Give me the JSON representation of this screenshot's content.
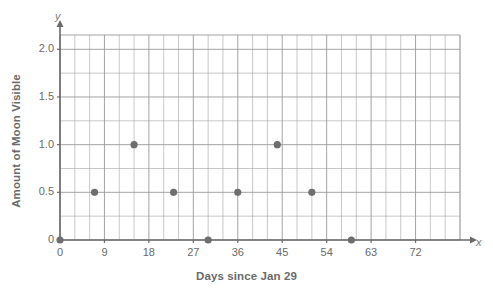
{
  "chart_data": {
    "type": "scatter",
    "title": "",
    "xlabel": "Days since Jan 29",
    "ylabel": "Amount of Moon Visible",
    "x_axis_letter": "x",
    "y_axis_letter": "y",
    "xlim": [
      0,
      81
    ],
    "ylim": [
      0,
      2.15
    ],
    "xticks": [
      0,
      9,
      18,
      27,
      36,
      45,
      54,
      63,
      72
    ],
    "xtick_labels": [
      "0",
      "9",
      "18",
      "27",
      "36",
      "45",
      "54",
      "63",
      "72"
    ],
    "yticks": [
      0,
      0.5,
      1.0,
      1.5,
      2.0
    ],
    "ytick_labels": [
      "0",
      "0.5",
      "1.0",
      "1.5",
      "2.0"
    ],
    "x_minor_step": 3,
    "y_minor_step": 0.25,
    "grid": true,
    "legend": null,
    "point_color": "#6e6e6e",
    "grid_color": "#9a9a9a",
    "axis_color": "#6a6a6a",
    "points": [
      {
        "x": 0,
        "y": 0.0
      },
      {
        "x": 7,
        "y": 0.5
      },
      {
        "x": 15,
        "y": 1.0
      },
      {
        "x": 23,
        "y": 0.5
      },
      {
        "x": 30,
        "y": 0.0
      },
      {
        "x": 36,
        "y": 0.5
      },
      {
        "x": 44,
        "y": 1.0
      },
      {
        "x": 51,
        "y": 0.5
      },
      {
        "x": 59,
        "y": 0.0
      }
    ]
  }
}
